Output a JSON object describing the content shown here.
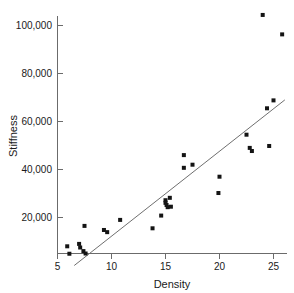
{
  "chart_data": {
    "type": "scatter",
    "title": "",
    "xlabel": "Density",
    "ylabel": "Stiffness",
    "xlim": [
      5.0,
      26.6
    ],
    "ylim": [
      0,
      108000
    ],
    "grid": false,
    "legend": null,
    "xticks": [
      5,
      10,
      15,
      20,
      25
    ],
    "xtick_labels": [
      "5",
      "10",
      "15",
      "20",
      "25"
    ],
    "yticks": [
      20000,
      40000,
      60000,
      80000,
      100000
    ],
    "ytick_labels": [
      "20,000",
      "40,000",
      "60,000",
      "80,000",
      "100,000"
    ],
    "marker": "square",
    "marker_color": "#141414",
    "marker_size_px": 4,
    "points": [
      {
        "x": 5.9,
        "y": 8000
      },
      {
        "x": 6.1,
        "y": 4900
      },
      {
        "x": 7.0,
        "y": 9000
      },
      {
        "x": 7.1,
        "y": 7500
      },
      {
        "x": 7.4,
        "y": 6000
      },
      {
        "x": 7.5,
        "y": 16500
      },
      {
        "x": 7.6,
        "y": 5000
      },
      {
        "x": 9.3,
        "y": 14800
      },
      {
        "x": 9.6,
        "y": 13900
      },
      {
        "x": 10.8,
        "y": 19000
      },
      {
        "x": 13.8,
        "y": 15500
      },
      {
        "x": 14.6,
        "y": 20800
      },
      {
        "x": 15.0,
        "y": 27200
      },
      {
        "x": 15.0,
        "y": 26100
      },
      {
        "x": 15.1,
        "y": 25200
      },
      {
        "x": 15.2,
        "y": 24300
      },
      {
        "x": 15.4,
        "y": 28200
      },
      {
        "x": 15.5,
        "y": 24500
      },
      {
        "x": 16.7,
        "y": 46000
      },
      {
        "x": 16.7,
        "y": 40700
      },
      {
        "x": 17.5,
        "y": 42000
      },
      {
        "x": 19.9,
        "y": 30200
      },
      {
        "x": 20.0,
        "y": 37000
      },
      {
        "x": 22.5,
        "y": 54500
      },
      {
        "x": 22.8,
        "y": 49000
      },
      {
        "x": 23.0,
        "y": 47700
      },
      {
        "x": 24.0,
        "y": 104400
      },
      {
        "x": 24.4,
        "y": 65500
      },
      {
        "x": 24.6,
        "y": 49800
      },
      {
        "x": 25.0,
        "y": 68800
      },
      {
        "x": 25.8,
        "y": 96300
      }
    ],
    "fit_line": {
      "label": "least-squares fit",
      "color": "#6f6f6f",
      "x1": 6.55,
      "y1": 0,
      "x2": 26.05,
      "y2": 69000
    }
  }
}
